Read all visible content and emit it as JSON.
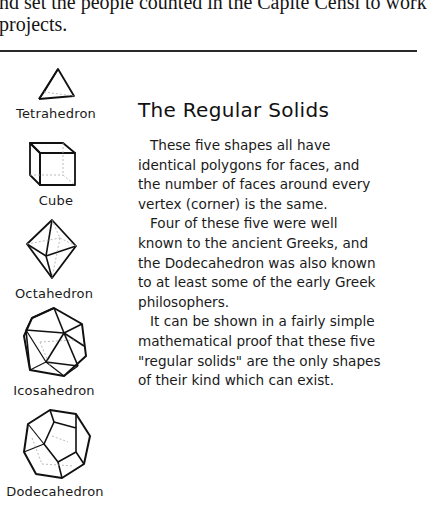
{
  "top_text": {
    "lines": [
      "nd set the people counted in the Capite Censi to work",
      "projects."
    ]
  },
  "solids": [
    {
      "name": "Tetrahedron",
      "icon": "tetrahedron-icon"
    },
    {
      "name": "Cube",
      "icon": "cube-icon"
    },
    {
      "name": "Octahedron",
      "icon": "octahedron-icon"
    },
    {
      "name": "Icosahedron",
      "icon": "icosahedron-icon"
    },
    {
      "name": "Dodecahedron",
      "icon": "dodecahedron-icon"
    }
  ],
  "article": {
    "title": "The Regular Solids",
    "lines": [
      "These five shapes all have",
      "identical polygons for faces, and",
      "the number of faces around every",
      "vertex (corner) is the same.",
      "Four of these five were well",
      "known to the ancient Greeks, and",
      "the Dodecahedron was also known",
      "to at least some of the early Greek",
      "philosophers.",
      "It can be shown in a fairly simple",
      "mathematical proof that these five",
      "\"regular solids\" are the only shapes",
      "of their kind which can exist."
    ]
  }
}
